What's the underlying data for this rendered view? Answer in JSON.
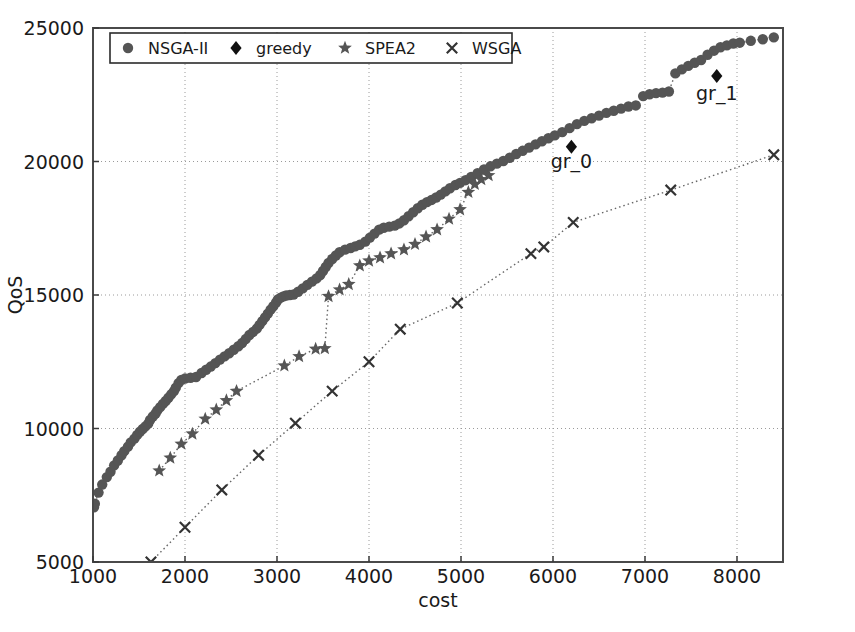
{
  "chart_data": {
    "type": "scatter",
    "title": "",
    "xlabel": "cost",
    "ylabel": "QoS",
    "xlim": [
      1000,
      8500
    ],
    "ylim": [
      5000,
      25000
    ],
    "xticks": [
      1000,
      2000,
      3000,
      4000,
      5000,
      6000,
      7000,
      8000
    ],
    "yticks": [
      5000,
      10000,
      15000,
      20000,
      25000
    ],
    "xtick_labels": [
      "1000",
      "2000",
      "3000",
      "4000",
      "5000",
      "6000",
      "7000",
      "8000"
    ],
    "ytick_labels": [
      "5000",
      "10000",
      "15000",
      "20000",
      "25000"
    ],
    "grid": true,
    "grid_style": "dotted",
    "legend_position": "upper left",
    "legend_entries": [
      {
        "label": "NSGA-II",
        "marker": "circle",
        "color": "#555555"
      },
      {
        "label": "greedy",
        "marker": "diamond",
        "color": "#111111"
      },
      {
        "label": "SPEA2",
        "marker": "star",
        "color": "#555555"
      },
      {
        "label": "WSGA",
        "marker": "x",
        "color": "#333333"
      }
    ],
    "annotations": [
      {
        "text": "gr_0",
        "x": 6200,
        "y": 19750,
        "point_x": 6200,
        "point_y": 20550
      },
      {
        "text": "gr_1",
        "x": 7780,
        "y": 22300,
        "point_x": 7780,
        "point_y": 23200
      }
    ],
    "series": [
      {
        "name": "NSGA-II",
        "marker": "circle",
        "color": "#555555",
        "connect": true,
        "points": [
          [
            1010,
            7050
          ],
          [
            1020,
            7180
          ],
          [
            1060,
            7600
          ],
          [
            1100,
            7900
          ],
          [
            1150,
            8180
          ],
          [
            1190,
            8380
          ],
          [
            1230,
            8620
          ],
          [
            1270,
            8800
          ],
          [
            1310,
            9000
          ],
          [
            1340,
            9150
          ],
          [
            1380,
            9320
          ],
          [
            1410,
            9480
          ],
          [
            1450,
            9620
          ],
          [
            1480,
            9760
          ],
          [
            1510,
            9880
          ],
          [
            1540,
            9980
          ],
          [
            1570,
            10080
          ],
          [
            1600,
            10180
          ],
          [
            1620,
            10320
          ],
          [
            1650,
            10450
          ],
          [
            1680,
            10560
          ],
          [
            1700,
            10680
          ],
          [
            1730,
            10800
          ],
          [
            1760,
            10920
          ],
          [
            1790,
            11030
          ],
          [
            1820,
            11150
          ],
          [
            1850,
            11280
          ],
          [
            1880,
            11400
          ],
          [
            1900,
            11530
          ],
          [
            1930,
            11700
          ],
          [
            1960,
            11820
          ],
          [
            2000,
            11870
          ],
          [
            2060,
            11900
          ],
          [
            2120,
            11930
          ],
          [
            2180,
            12080
          ],
          [
            2230,
            12200
          ],
          [
            2280,
            12320
          ],
          [
            2330,
            12450
          ],
          [
            2380,
            12580
          ],
          [
            2430,
            12700
          ],
          [
            2480,
            12820
          ],
          [
            2530,
            12950
          ],
          [
            2580,
            13080
          ],
          [
            2620,
            13200
          ],
          [
            2660,
            13350
          ],
          [
            2700,
            13500
          ],
          [
            2740,
            13620
          ],
          [
            2780,
            13740
          ],
          [
            2810,
            13880
          ],
          [
            2840,
            14020
          ],
          [
            2870,
            14160
          ],
          [
            2900,
            14300
          ],
          [
            2930,
            14450
          ],
          [
            2960,
            14580
          ],
          [
            2990,
            14720
          ],
          [
            3010,
            14830
          ],
          [
            3040,
            14900
          ],
          [
            3070,
            14950
          ],
          [
            3100,
            14980
          ],
          [
            3140,
            15000
          ],
          [
            3180,
            15020
          ],
          [
            3230,
            15120
          ],
          [
            3280,
            15250
          ],
          [
            3330,
            15380
          ],
          [
            3380,
            15500
          ],
          [
            3430,
            15620
          ],
          [
            3470,
            15750
          ],
          [
            3500,
            15900
          ],
          [
            3530,
            16050
          ],
          [
            3560,
            16200
          ],
          [
            3600,
            16350
          ],
          [
            3640,
            16480
          ],
          [
            3680,
            16600
          ],
          [
            3740,
            16700
          ],
          [
            3800,
            16760
          ],
          [
            3850,
            16820
          ],
          [
            3900,
            16880
          ],
          [
            3960,
            17000
          ],
          [
            4010,
            17150
          ],
          [
            4060,
            17300
          ],
          [
            4110,
            17450
          ],
          [
            4160,
            17520
          ],
          [
            4220,
            17560
          ],
          [
            4280,
            17600
          ],
          [
            4330,
            17680
          ],
          [
            4380,
            17800
          ],
          [
            4430,
            17950
          ],
          [
            4480,
            18100
          ],
          [
            4530,
            18250
          ],
          [
            4580,
            18380
          ],
          [
            4630,
            18480
          ],
          [
            4680,
            18560
          ],
          [
            4730,
            18650
          ],
          [
            4780,
            18760
          ],
          [
            4830,
            18880
          ],
          [
            4880,
            19000
          ],
          [
            4940,
            19120
          ],
          [
            4990,
            19200
          ],
          [
            5050,
            19300
          ],
          [
            5110,
            19420
          ],
          [
            5180,
            19560
          ],
          [
            5250,
            19700
          ],
          [
            5320,
            19820
          ],
          [
            5390,
            19920
          ],
          [
            5460,
            20020
          ],
          [
            5530,
            20140
          ],
          [
            5600,
            20280
          ],
          [
            5670,
            20400
          ],
          [
            5740,
            20520
          ],
          [
            5810,
            20640
          ],
          [
            5880,
            20760
          ],
          [
            5950,
            20870
          ],
          [
            6020,
            20980
          ],
          [
            6100,
            21100
          ],
          [
            6180,
            21250
          ],
          [
            6260,
            21400
          ],
          [
            6340,
            21520
          ],
          [
            6420,
            21620
          ],
          [
            6500,
            21720
          ],
          [
            6580,
            21820
          ],
          [
            6660,
            21900
          ],
          [
            6740,
            21980
          ],
          [
            6820,
            22060
          ],
          [
            6900,
            22100
          ],
          [
            6980,
            22450
          ],
          [
            7050,
            22520
          ],
          [
            7120,
            22560
          ],
          [
            7190,
            22580
          ],
          [
            7260,
            22620
          ],
          [
            7330,
            23300
          ],
          [
            7400,
            23450
          ],
          [
            7470,
            23580
          ],
          [
            7540,
            23700
          ],
          [
            7610,
            23800
          ],
          [
            7680,
            24000
          ],
          [
            7750,
            24150
          ],
          [
            7820,
            24280
          ],
          [
            7890,
            24350
          ],
          [
            7960,
            24420
          ],
          [
            8030,
            24450
          ],
          [
            8150,
            24520
          ],
          [
            8280,
            24580
          ],
          [
            8400,
            24650
          ]
        ]
      },
      {
        "name": "SPEA2",
        "marker": "star",
        "color": "#555555",
        "connect": true,
        "points": [
          [
            1720,
            8420
          ],
          [
            1840,
            8900
          ],
          [
            1960,
            9420
          ],
          [
            2080,
            9800
          ],
          [
            2220,
            10360
          ],
          [
            2340,
            10700
          ],
          [
            2450,
            11050
          ],
          [
            2560,
            11400
          ],
          [
            3080,
            12350
          ],
          [
            3240,
            12700
          ],
          [
            3420,
            12980
          ],
          [
            3520,
            13000
          ],
          [
            3560,
            14950
          ],
          [
            3680,
            15200
          ],
          [
            3780,
            15400
          ],
          [
            3900,
            16100
          ],
          [
            4000,
            16280
          ],
          [
            4120,
            16400
          ],
          [
            4240,
            16550
          ],
          [
            4380,
            16700
          ],
          [
            4500,
            16900
          ],
          [
            4620,
            17180
          ],
          [
            4740,
            17450
          ],
          [
            4870,
            17850
          ],
          [
            4990,
            18200
          ],
          [
            5080,
            18850
          ],
          [
            5150,
            19150
          ],
          [
            5220,
            19330
          ],
          [
            5300,
            19480
          ]
        ]
      },
      {
        "name": "WSGA",
        "marker": "x",
        "color": "#333333",
        "connect": true,
        "points": [
          [
            1630,
            5000
          ],
          [
            2000,
            6300
          ],
          [
            2400,
            7700
          ],
          [
            2800,
            9000
          ],
          [
            3200,
            10200
          ],
          [
            3600,
            11400
          ],
          [
            4000,
            12500
          ],
          [
            4340,
            13720
          ],
          [
            4960,
            14700
          ],
          [
            5760,
            16550
          ],
          [
            5900,
            16800
          ],
          [
            6220,
            17720
          ],
          [
            7280,
            18930
          ],
          [
            8400,
            20250
          ]
        ]
      },
      {
        "name": "greedy",
        "marker": "diamond",
        "color": "#111111",
        "connect": false,
        "points": [
          [
            6200,
            20550
          ],
          [
            7780,
            23200
          ]
        ]
      }
    ]
  }
}
